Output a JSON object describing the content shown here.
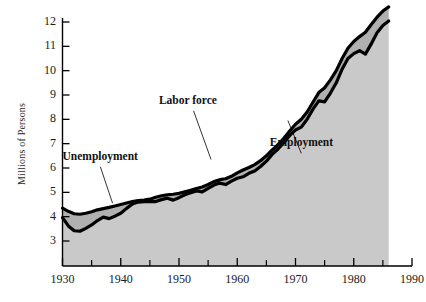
{
  "chart_data": {
    "type": "area",
    "title": "",
    "subtitle": "",
    "xlabel": "",
    "ylabel": "Millions of Persons",
    "xlim": [
      1930,
      1990
    ],
    "ylim": [
      2.2,
      12.6
    ],
    "grid": false,
    "legend_position": "inline-annotations",
    "x_major_ticks": [
      1930,
      1940,
      1950,
      1960,
      1970,
      1980,
      1990
    ],
    "x_minor_ticks": [
      1935,
      1945,
      1955,
      1965,
      1975,
      1985
    ],
    "y_ticks": [
      3,
      4,
      5,
      6,
      7,
      8,
      9,
      10,
      11,
      12
    ],
    "x_tick_labels": [
      "1930",
      "1940",
      "1950",
      "1960",
      "1970",
      "1980",
      "1990"
    ],
    "y_tick_labels": [
      "3",
      "4",
      "5",
      "6",
      "7",
      "8",
      "9",
      "10",
      "11",
      "12"
    ],
    "annotations": [
      {
        "text": "Unemployment",
        "x": 1936.5,
        "y": 6.05,
        "leader_to_x": 1938.6,
        "leader_to_y": 4.55
      },
      {
        "text": "Labor force",
        "x": 1952.5,
        "y": 8.35,
        "leader_to_x": 1955.5,
        "leader_to_y": 6.35
      },
      {
        "text": "Employment",
        "x": 1971.0,
        "y": 6.6,
        "leader_to_x": 1968.7,
        "leader_to_y": 7.95
      }
    ],
    "x": [
      1930,
      1931,
      1932,
      1933,
      1934,
      1935,
      1936,
      1937,
      1938,
      1939,
      1940,
      1941,
      1942,
      1943,
      1944,
      1945,
      1946,
      1947,
      1948,
      1949,
      1950,
      1951,
      1952,
      1953,
      1954,
      1955,
      1956,
      1957,
      1958,
      1959,
      1960,
      1961,
      1962,
      1963,
      1964,
      1965,
      1966,
      1967,
      1968,
      1969,
      1970,
      1971,
      1972,
      1973,
      1974,
      1975,
      1976,
      1977,
      1978,
      1979,
      1980,
      1981,
      1982,
      1983,
      1984,
      1985,
      1986
    ],
    "series": [
      {
        "name": "Labor force",
        "color": "#000000",
        "values": [
          4.35,
          4.22,
          4.12,
          4.1,
          4.14,
          4.2,
          4.28,
          4.33,
          4.38,
          4.44,
          4.5,
          4.56,
          4.62,
          4.66,
          4.68,
          4.72,
          4.8,
          4.86,
          4.9,
          4.92,
          4.96,
          5.02,
          5.08,
          5.16,
          5.22,
          5.32,
          5.44,
          5.52,
          5.56,
          5.66,
          5.8,
          5.92,
          6.02,
          6.14,
          6.3,
          6.5,
          6.74,
          6.96,
          7.22,
          7.52,
          7.8,
          8.0,
          8.3,
          8.7,
          9.1,
          9.3,
          9.62,
          10.0,
          10.5,
          10.92,
          11.2,
          11.4,
          11.58,
          11.9,
          12.2,
          12.45,
          12.62
        ]
      },
      {
        "name": "Employment",
        "color": "#000000",
        "values": [
          3.96,
          3.62,
          3.42,
          3.4,
          3.52,
          3.66,
          3.84,
          3.98,
          3.92,
          4.02,
          4.14,
          4.34,
          4.52,
          4.6,
          4.62,
          4.62,
          4.62,
          4.7,
          4.76,
          4.68,
          4.78,
          4.9,
          4.98,
          5.06,
          5.02,
          5.16,
          5.3,
          5.38,
          5.32,
          5.46,
          5.58,
          5.64,
          5.78,
          5.88,
          6.06,
          6.28,
          6.56,
          6.78,
          7.04,
          7.34,
          7.56,
          7.68,
          8.0,
          8.42,
          8.76,
          8.72,
          9.08,
          9.5,
          10.06,
          10.5,
          10.7,
          10.82,
          10.68,
          11.1,
          11.56,
          11.86,
          12.04
        ]
      }
    ],
    "fill_color": "#c9c9c9",
    "band_color": "#b0b0b0",
    "line_width": 3.2
  },
  "axis": {
    "y_title": "Millions of Persons"
  }
}
